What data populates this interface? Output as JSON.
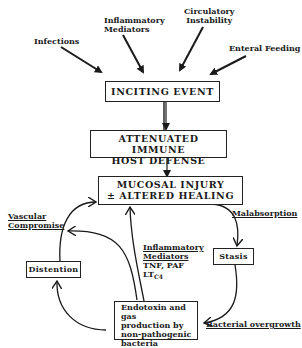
{
  "diagram": {
    "causes": [
      {
        "id": "infections",
        "label": "Infections"
      },
      {
        "id": "inflammatory_mediators",
        "line1": "Inflammatory",
        "line2": "Mediators"
      },
      {
        "id": "circulatory_instability",
        "line1": "Circulatory",
        "line2": "Instability"
      },
      {
        "id": "enteral_feeding",
        "label": "Enteral Feeding"
      }
    ],
    "nodes": {
      "inciting_event": "INCITING EVENT",
      "attenuated": {
        "line1": "ATTENUATED IMMUNE",
        "line2": "HOST DEFENSE"
      },
      "mucosal": {
        "line1": "MUCOSAL INJURY",
        "line2": "± ALTERED HEALING"
      },
      "stasis": "Stasis",
      "distention": "Distention",
      "endotoxin": {
        "line1": "Endotoxin and  gas",
        "line2": "production by",
        "line3": "non-pathogenic",
        "line4": "bacteria"
      }
    },
    "edge_labels": {
      "vascular": {
        "line1": "Vascular",
        "line2": "Compromise"
      },
      "malabsorption": "Malabsorption",
      "bacterial_overgrowth": "Bacterial overgrowth",
      "inflammatory": {
        "line1": "Inflammatory",
        "line2": "Mediators",
        "line3": "TNF, PAF",
        "line4_main": "LT",
        "line4_sub": "C4"
      }
    },
    "colors": {
      "ink": "#1a1a1a",
      "background": "#ffffff"
    }
  }
}
